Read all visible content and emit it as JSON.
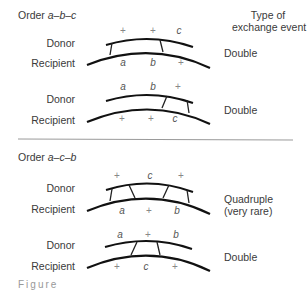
{
  "header": {
    "type_label_line1": "Type of",
    "type_label_line2": "exchange event"
  },
  "sections": [
    {
      "order_prefix": "Order ",
      "order": "a–b–c",
      "diagrams": [
        {
          "donor_label": "Donor",
          "recipient_label": "Recipient",
          "donor_markers": [
            "+",
            "+",
            "c"
          ],
          "recipient_markers": [
            "a",
            "b",
            "+"
          ],
          "event_type": "Double",
          "event_note": ""
        },
        {
          "donor_label": "Donor",
          "recipient_label": "Recipient",
          "donor_markers": [
            "a",
            "b",
            "+"
          ],
          "recipient_markers": [
            "+",
            "+",
            "c"
          ],
          "event_type": "Double",
          "event_note": ""
        }
      ]
    },
    {
      "order_prefix": "Order ",
      "order": "a–c–b",
      "diagrams": [
        {
          "donor_label": "Donor",
          "recipient_label": "Recipient",
          "donor_markers": [
            "+",
            "c",
            "+"
          ],
          "recipient_markers": [
            "a",
            "+",
            "b"
          ],
          "event_type": "Quadruple",
          "event_note": "(very rare)"
        },
        {
          "donor_label": "Donor",
          "recipient_label": "Recipient",
          "donor_markers": [
            "a",
            "+",
            "b"
          ],
          "recipient_markers": [
            "+",
            "c",
            "+"
          ],
          "event_type": "Double",
          "event_note": ""
        }
      ]
    }
  ],
  "caption_fragment": "Figure"
}
